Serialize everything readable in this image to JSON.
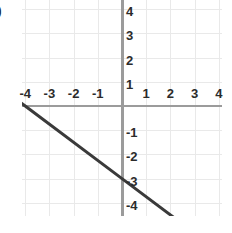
{
  "option_marker": ")",
  "chart_data": {
    "type": "line",
    "title": "",
    "xlabel": "",
    "ylabel": "",
    "xlim": [
      -5,
      5
    ],
    "ylim": [
      -5,
      5
    ],
    "grid": true,
    "legend": "none",
    "x_ticks": [
      -4,
      -3,
      -2,
      -1,
      1,
      2,
      3,
      4
    ],
    "y_ticks": [
      4,
      3,
      2,
      1,
      -1,
      -2,
      -3,
      -4
    ],
    "x_tick_labels": [
      "-4",
      "-3",
      "-2",
      "-1",
      "1",
      "2",
      "3",
      "4"
    ],
    "y_tick_labels": [
      "4",
      "3",
      "2",
      "1",
      "-1",
      "-2",
      "-3",
      "-4"
    ],
    "series": [
      {
        "name": "line",
        "equation": "y = -0.75x - 3",
        "slope": -0.75,
        "intercept": -3,
        "color": "#3a3a3a",
        "points": [
          {
            "x": -4.4,
            "y": 0.3
          },
          {
            "x": -4,
            "y": 0
          },
          {
            "x": 0,
            "y": -3
          },
          {
            "x": 2.6,
            "y": -4.95
          }
        ]
      }
    ],
    "axis_color": "#9b9b9b",
    "grid_color": "#e9e9e9",
    "background": "#ffffff"
  }
}
